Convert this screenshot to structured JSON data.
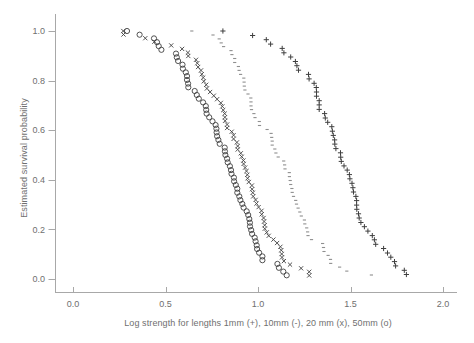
{
  "figure": {
    "background": "#ffffff",
    "text_color": "#6f6f6f",
    "axis_color": "#a8a8a8",
    "marker_color": "#3f3f3f",
    "dash_marker_color": "#8f8f8f"
  },
  "chart_data": {
    "type": "scatter",
    "title": "",
    "xlabel": "Log strength for lengths 1mm (+), 10mm (-), 20 mm (x), 50mm (o)",
    "ylabel": "Estimated survival probability",
    "xlim": [
      0.0,
      2.0
    ],
    "ylim": [
      0.0,
      1.0
    ],
    "x_ticks": [
      0.0,
      0.5,
      1.0,
      1.5,
      2.0
    ],
    "x_tick_labels": [
      "0.0",
      "0.5",
      "1.0",
      "1.5",
      "2.0"
    ],
    "y_ticks": [
      0.0,
      0.2,
      0.4,
      0.6,
      0.8,
      1.0
    ],
    "y_tick_labels": [
      "0.0",
      "0.2",
      "0.4",
      "0.6",
      "0.8",
      "1.0"
    ],
    "grid": false,
    "legend_position": "encoded-in-x-axis-label",
    "series": [
      {
        "name": "1mm",
        "marker": "plus",
        "n": 57,
        "x": [
          0.81,
          0.971,
          1.045,
          1.068,
          1.131,
          1.14,
          1.177,
          1.202,
          1.21,
          1.219,
          1.273,
          1.276,
          1.303,
          1.315,
          1.316,
          1.316,
          1.331,
          1.331,
          1.331,
          1.36,
          1.364,
          1.377,
          1.399,
          1.402,
          1.407,
          1.414,
          1.415,
          1.421,
          1.446,
          1.447,
          1.45,
          1.465,
          1.482,
          1.494,
          1.497,
          1.508,
          1.513,
          1.516,
          1.529,
          1.533,
          1.533,
          1.534,
          1.543,
          1.547,
          1.556,
          1.575,
          1.594,
          1.618,
          1.629,
          1.636,
          1.679,
          1.7,
          1.718,
          1.738,
          1.744,
          1.791,
          1.802
        ],
        "y": [
          1.0,
          0.982,
          0.965,
          0.947,
          0.93,
          0.912,
          0.895,
          0.877,
          0.86,
          0.842,
          0.825,
          0.807,
          0.789,
          0.772,
          0.754,
          0.737,
          0.719,
          0.702,
          0.684,
          0.667,
          0.649,
          0.632,
          0.614,
          0.596,
          0.579,
          0.561,
          0.544,
          0.526,
          0.509,
          0.491,
          0.474,
          0.456,
          0.439,
          0.421,
          0.404,
          0.386,
          0.368,
          0.351,
          0.333,
          0.316,
          0.298,
          0.281,
          0.263,
          0.246,
          0.228,
          0.211,
          0.193,
          0.175,
          0.158,
          0.14,
          0.123,
          0.105,
          0.088,
          0.07,
          0.053,
          0.035,
          0.018
        ]
      },
      {
        "name": "10mm",
        "marker": "dash",
        "n": 63,
        "x": [
          0.642,
          0.757,
          0.79,
          0.801,
          0.814,
          0.854,
          0.859,
          0.874,
          0.874,
          0.894,
          0.898,
          0.906,
          0.923,
          0.925,
          0.926,
          0.929,
          0.946,
          0.961,
          0.962,
          0.962,
          0.965,
          0.978,
          0.984,
          1.007,
          1.008,
          1.049,
          1.071,
          1.074,
          1.077,
          1.077,
          1.091,
          1.097,
          1.109,
          1.139,
          1.144,
          1.146,
          1.169,
          1.17,
          1.174,
          1.177,
          1.183,
          1.185,
          1.192,
          1.204,
          1.208,
          1.217,
          1.226,
          1.234,
          1.251,
          1.253,
          1.263,
          1.268,
          1.27,
          1.289,
          1.349,
          1.354,
          1.357,
          1.379,
          1.392,
          1.393,
          1.441,
          1.48,
          1.613
        ],
        "y": [
          1.0,
          0.984,
          0.968,
          0.952,
          0.937,
          0.921,
          0.905,
          0.889,
          0.873,
          0.857,
          0.841,
          0.825,
          0.81,
          0.794,
          0.778,
          0.762,
          0.746,
          0.73,
          0.714,
          0.698,
          0.683,
          0.667,
          0.651,
          0.635,
          0.619,
          0.603,
          0.587,
          0.571,
          0.556,
          0.54,
          0.524,
          0.508,
          0.492,
          0.476,
          0.46,
          0.444,
          0.429,
          0.413,
          0.397,
          0.381,
          0.365,
          0.349,
          0.333,
          0.317,
          0.302,
          0.286,
          0.27,
          0.254,
          0.238,
          0.222,
          0.206,
          0.19,
          0.175,
          0.159,
          0.143,
          0.127,
          0.111,
          0.095,
          0.079,
          0.063,
          0.048,
          0.032,
          0.016
        ]
      },
      {
        "name": "20mm",
        "marker": "x",
        "n": 69,
        "x": [
          0.272,
          0.273,
          0.391,
          0.44,
          0.531,
          0.59,
          0.621,
          0.623,
          0.665,
          0.672,
          0.676,
          0.692,
          0.696,
          0.704,
          0.707,
          0.72,
          0.724,
          0.741,
          0.761,
          0.779,
          0.799,
          0.807,
          0.812,
          0.82,
          0.821,
          0.822,
          0.833,
          0.833,
          0.858,
          0.868,
          0.868,
          0.886,
          0.89,
          0.89,
          0.907,
          0.912,
          0.921,
          0.922,
          0.93,
          0.938,
          0.942,
          0.944,
          0.95,
          0.967,
          0.968,
          0.972,
          0.974,
          0.987,
          0.992,
          1.003,
          1.019,
          1.02,
          1.03,
          1.033,
          1.036,
          1.037,
          1.047,
          1.058,
          1.083,
          1.103,
          1.121,
          1.126,
          1.128,
          1.13,
          1.14,
          1.173,
          1.233,
          1.277,
          1.277
        ],
        "y": [
          1.0,
          0.986,
          0.971,
          0.957,
          0.942,
          0.928,
          0.913,
          0.899,
          0.884,
          0.87,
          0.855,
          0.841,
          0.826,
          0.812,
          0.797,
          0.783,
          0.768,
          0.754,
          0.739,
          0.725,
          0.71,
          0.696,
          0.681,
          0.667,
          0.652,
          0.638,
          0.623,
          0.609,
          0.594,
          0.58,
          0.565,
          0.551,
          0.536,
          0.522,
          0.507,
          0.493,
          0.478,
          0.464,
          0.449,
          0.435,
          0.42,
          0.406,
          0.391,
          0.377,
          0.362,
          0.348,
          0.333,
          0.319,
          0.304,
          0.29,
          0.275,
          0.261,
          0.246,
          0.232,
          0.217,
          0.203,
          0.188,
          0.174,
          0.159,
          0.145,
          0.13,
          0.116,
          0.101,
          0.087,
          0.072,
          0.058,
          0.043,
          0.029,
          0.014
        ]
      },
      {
        "name": "50mm",
        "marker": "circle",
        "n": 66,
        "x": [
          0.292,
          0.36,
          0.438,
          0.454,
          0.463,
          0.478,
          0.557,
          0.561,
          0.568,
          0.592,
          0.594,
          0.61,
          0.616,
          0.616,
          0.622,
          0.623,
          0.658,
          0.669,
          0.68,
          0.703,
          0.718,
          0.72,
          0.722,
          0.736,
          0.754,
          0.771,
          0.775,
          0.776,
          0.779,
          0.786,
          0.793,
          0.82,
          0.821,
          0.824,
          0.833,
          0.836,
          0.848,
          0.854,
          0.857,
          0.87,
          0.871,
          0.88,
          0.888,
          0.888,
          0.899,
          0.905,
          0.915,
          0.922,
          0.939,
          0.947,
          0.953,
          0.956,
          0.957,
          0.963,
          0.968,
          0.982,
          0.987,
          0.993,
          0.995,
          1.006,
          1.024,
          1.024,
          1.105,
          1.113,
          1.137,
          1.155
        ],
        "y": [
          1.0,
          0.985,
          0.97,
          0.955,
          0.939,
          0.924,
          0.909,
          0.894,
          0.879,
          0.864,
          0.848,
          0.833,
          0.818,
          0.803,
          0.788,
          0.773,
          0.758,
          0.742,
          0.727,
          0.712,
          0.697,
          0.682,
          0.667,
          0.652,
          0.636,
          0.621,
          0.606,
          0.591,
          0.576,
          0.561,
          0.545,
          0.53,
          0.515,
          0.5,
          0.485,
          0.47,
          0.455,
          0.439,
          0.424,
          0.409,
          0.394,
          0.379,
          0.364,
          0.348,
          0.333,
          0.318,
          0.303,
          0.288,
          0.273,
          0.258,
          0.242,
          0.227,
          0.212,
          0.197,
          0.182,
          0.167,
          0.152,
          0.136,
          0.121,
          0.106,
          0.091,
          0.076,
          0.061,
          0.045,
          0.03,
          0.015
        ]
      }
    ]
  }
}
